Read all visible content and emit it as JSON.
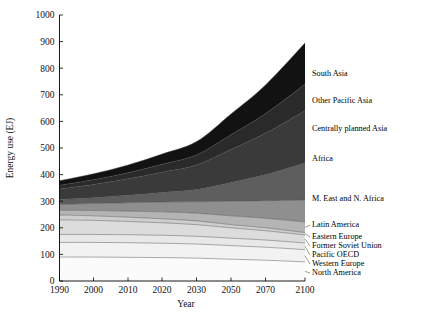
{
  "chart_data": {
    "type": "area",
    "title": "",
    "xlabel": "Year",
    "ylabel": "Energy use (EJ)",
    "xlim": [
      1990,
      2100
    ],
    "ylim": [
      0,
      1000
    ],
    "grid": false,
    "stacked": true,
    "legend_position": "right-inline",
    "x": [
      1990,
      2000,
      2010,
      2020,
      2030,
      2050,
      2070,
      2100
    ],
    "xticks": [
      "1990",
      "2000",
      "2010",
      "2020",
      "2030",
      "2050",
      "2070",
      "2100"
    ],
    "yticks": [
      "0",
      "100",
      "200",
      "300",
      "400",
      "500",
      "600",
      "700",
      "800",
      "900",
      "1000"
    ],
    "series": [
      {
        "name": "North America",
        "color": "#fbfbfb",
        "values": [
          90,
          90,
          89,
          88,
          86,
          82,
          78,
          72
        ]
      },
      {
        "name": "Western Europe",
        "color": "#f2f2f2",
        "values": [
          55,
          55,
          55,
          54,
          53,
          51,
          49,
          46
        ]
      },
      {
        "name": "Pacific OECD",
        "color": "#e8e8e8",
        "values": [
          30,
          30,
          30,
          30,
          29,
          28,
          27,
          25
        ]
      },
      {
        "name": "Former Soviet Union",
        "color": "#dcdcdc",
        "values": [
          55,
          53,
          50,
          47,
          44,
          39,
          35,
          30
        ]
      },
      {
        "name": "Eastern Europe",
        "color": "#cecece",
        "values": [
          18,
          17,
          16,
          15,
          14,
          12,
          11,
          9
        ]
      },
      {
        "name": "Latin America",
        "color": "#b4b4b4",
        "values": [
          18,
          20,
          23,
          26,
          29,
          33,
          36,
          40
        ]
      },
      {
        "name": "M. East and N. Africa",
        "color": "#8f8f8f",
        "values": [
          22,
          26,
          31,
          37,
          43,
          55,
          66,
          82
        ]
      },
      {
        "name": "Africa",
        "color": "#5e5e5e",
        "values": [
          18,
          22,
          28,
          36,
          46,
          70,
          98,
          140
        ]
      },
      {
        "name": "Centrally planned Asia",
        "color": "#3a3a3a",
        "values": [
          40,
          50,
          62,
          76,
          92,
          124,
          155,
          196
        ]
      },
      {
        "name": "Other Pacific Asia",
        "color": "#2a2a2a",
        "values": [
          14,
          18,
          23,
          30,
          38,
          56,
          74,
          100
        ]
      },
      {
        "name": "South Asia",
        "color": "#121212",
        "values": [
          17,
          22,
          29,
          38,
          50,
          78,
          108,
          155
        ]
      }
    ],
    "totals_note": [
      377,
      403,
      436,
      477,
      524,
      628,
      737,
      895
    ]
  },
  "legend_entries": [
    {
      "label": "South Asia",
      "y": 74
    },
    {
      "label": "Other Pacific Asia",
      "y": 101
    },
    {
      "label": "Centrally planned Asia",
      "y": 129
    },
    {
      "label": "Africa",
      "y": 159
    },
    {
      "label": "M. East and N. Africa",
      "y": 199
    },
    {
      "label": "Latin America",
      "y": 225
    },
    {
      "label": "Eastern Europe",
      "y": 237
    },
    {
      "label": "Former Soviet Union",
      "y": 246
    },
    {
      "label": "Pacific OECD",
      "y": 255
    },
    {
      "label": "Western Europe",
      "y": 264
    },
    {
      "label": "North America",
      "y": 273
    }
  ]
}
